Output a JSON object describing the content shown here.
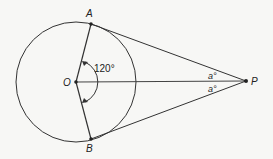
{
  "diagram": {
    "points": {
      "A": {
        "label": "A",
        "x": 91,
        "y": 24
      },
      "B": {
        "label": "B",
        "x": 91,
        "y": 139
      },
      "O": {
        "label": "O",
        "x": 76,
        "y": 82
      },
      "P": {
        "label": "P",
        "x": 246,
        "y": 81
      }
    },
    "circle": {
      "cx": 76,
      "cy": 82,
      "r": 60
    },
    "angles": {
      "AOB": "120°",
      "APO": "a°",
      "BPO": "a°"
    },
    "colors": {
      "stroke": "#333333",
      "background": "#f7f7f5"
    }
  }
}
